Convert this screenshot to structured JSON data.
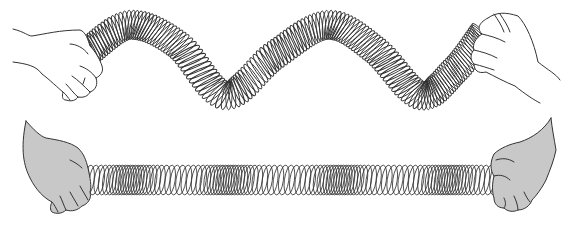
{
  "figure": {
    "width": 573,
    "height": 229,
    "background": "#ffffff"
  },
  "colors": {
    "coil_stroke": "#333333",
    "hand_outline": "#333333",
    "hand_fill_top": "#ffffff",
    "hand_fill_bottom": "#c8c8c8",
    "compression_shade": "#555555"
  },
  "transverse_wave": {
    "label": "transverse-wave-spring",
    "tube_radius": 15,
    "coil_count": 150,
    "path_points": [
      [
        88,
        52
      ],
      [
        130,
        25
      ],
      [
        178,
        45
      ],
      [
        225,
        95
      ],
      [
        275,
        55
      ],
      [
        328,
        25
      ],
      [
        375,
        50
      ],
      [
        420,
        95
      ],
      [
        455,
        70
      ],
      [
        482,
        35
      ]
    ]
  },
  "longitudinal_wave": {
    "label": "longitudinal-wave-spring",
    "x_start": 78,
    "x_end": 495,
    "y_center": 180,
    "coil_half_height": 15,
    "coil_half_width": 5,
    "coil_count": 110,
    "compressions_x": [
      130,
      228,
      340,
      448
    ],
    "compression_strength": 0.55
  },
  "hands": [
    {
      "id": "top-left-hand",
      "style": "outline"
    },
    {
      "id": "top-right-hand",
      "style": "outline"
    },
    {
      "id": "bottom-left-hand",
      "style": "filled"
    },
    {
      "id": "bottom-right-hand",
      "style": "filled"
    }
  ]
}
